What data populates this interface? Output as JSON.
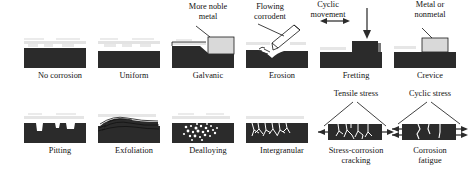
{
  "figure": {
    "rows": [
      {
        "row": 1,
        "cells": [
          {
            "id": "no-corrosion",
            "caption": "No corrosion",
            "annotation": ""
          },
          {
            "id": "uniform",
            "caption": "Uniform",
            "annotation": ""
          },
          {
            "id": "galvanic",
            "caption": "Galvanic",
            "annotation": "More noble\nmetal",
            "annotation_line1": "More noble",
            "annotation_line2": "metal"
          },
          {
            "id": "erosion",
            "caption": "Erosion",
            "annotation": "Flowing\ncorrodent",
            "annotation_line1": "Flowing",
            "annotation_line2": "corrodent"
          },
          {
            "id": "fretting",
            "caption": "Fretting",
            "annotation": "Cyclic movement / Load",
            "annotation_line1": "Cyclic",
            "annotation_line2": "movement",
            "annotation_line3": "Load"
          },
          {
            "id": "crevice",
            "caption": "Crevice",
            "annotation": "Metal or\nnonmetal",
            "annotation_line1": "Metal or",
            "annotation_line2": "nonmetal"
          }
        ]
      },
      {
        "row": 2,
        "cells": [
          {
            "id": "pitting",
            "caption": "Pitting",
            "annotation": ""
          },
          {
            "id": "exfoliation",
            "caption": "Exfoliation",
            "annotation": ""
          },
          {
            "id": "dealloying",
            "caption": "Dealloying",
            "annotation": ""
          },
          {
            "id": "intergranular",
            "caption": "Intergranular",
            "annotation": ""
          },
          {
            "id": "stress-corrosion-cracking",
            "caption_line1": "Stress-corrosion",
            "caption_line2": "cracking",
            "caption": "Stress-corrosion cracking",
            "annotation": "Tensile stress"
          },
          {
            "id": "corrosion-fatigue",
            "caption_line1": "Corrosion",
            "caption_line2": "fatigue",
            "caption": "Corrosion fatigue",
            "annotation": "Cyclic stress"
          }
        ]
      }
    ]
  },
  "colors": {
    "metal_dark": "#2b2b2b",
    "metal_light": "#d9d9d9",
    "background": "#ffffff",
    "ink": "#111111"
  }
}
